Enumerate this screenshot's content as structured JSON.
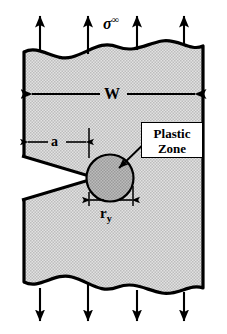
{
  "figure": {
    "background_color": "#ffffff",
    "plate_fill_color": "#d4d4d4",
    "plastic_zone_color": "#a8a8a8",
    "line_color": "#000000"
  },
  "labels": {
    "remote_stress": "σ",
    "remote_stress_superscript": "∞",
    "width": "W",
    "crack_length": "a",
    "plastic_zone_radius": "r",
    "plastic_zone_radius_subscript": "y",
    "plastic_zone_line_1": "Plastic",
    "plastic_zone_line_2": "Zone"
  },
  "annotations": {
    "top_arrow_count": 4,
    "bottom_arrow_count": 4,
    "top_arrow_direction": "up",
    "bottom_arrow_direction": "down",
    "width_dimension": "double-headed horizontal arrow spanning plate width",
    "crack_dimension": "double-headed horizontal arrow from left edge to crack tip",
    "plastic_zone_dimension": "double-headed horizontal arrow spanning plastic zone diameter",
    "callout": "leader arrow from Plastic Zone box to circle"
  }
}
